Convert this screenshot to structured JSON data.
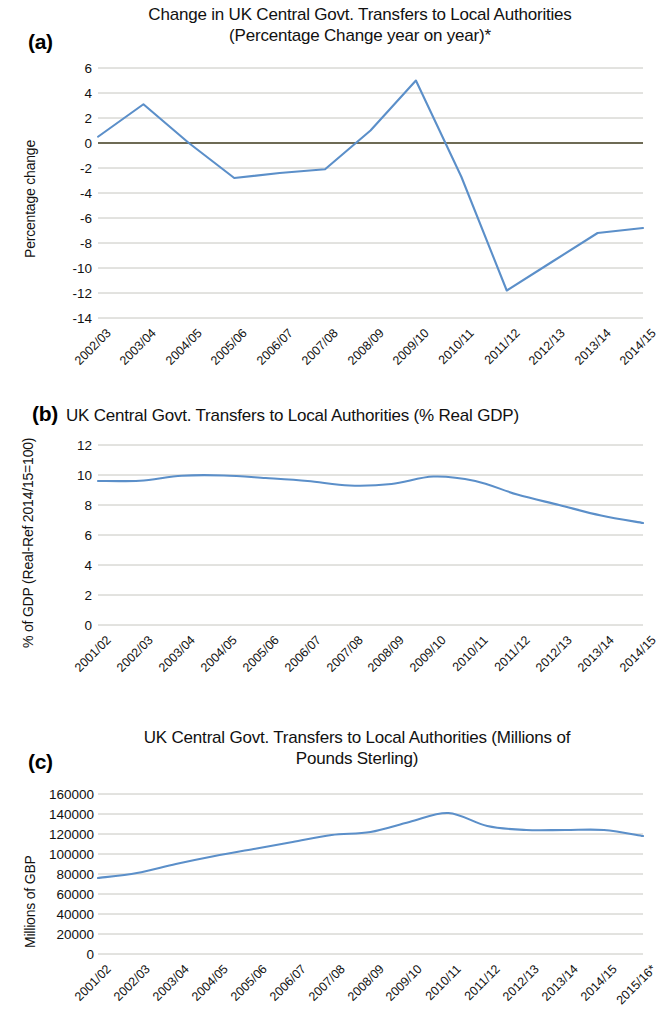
{
  "figure": {
    "panels": [
      "(a)",
      "(b)",
      "(c)"
    ]
  },
  "chart_data": [
    {
      "panel": "(a)",
      "type": "line",
      "title": "Change in UK Central Govt. Transfers to Local Authorities (Percentage Change year on year)*",
      "title_line1": "Change in UK Central Govt. Transfers to Local Authorities",
      "title_line2": "(Percentage Change year on year)*",
      "xlabel": "",
      "ylabel": "Percentage change",
      "ylim": [
        -14,
        6
      ],
      "yticks": [
        6,
        4,
        2,
        0,
        -2,
        -4,
        -6,
        -8,
        -10,
        -12,
        -14
      ],
      "ytick_labels": [
        "6",
        "4",
        "2",
        "0",
        "-2",
        "-4",
        "-6",
        "-8",
        "-10",
        "-12",
        "-14"
      ],
      "grid": true,
      "legend": "none",
      "reference_line": 0,
      "categories": [
        "2002/03",
        "2003/04",
        "2004/05",
        "2005/06",
        "2006/07",
        "2007/08",
        "2008/09",
        "2009/10",
        "2010/11",
        "2011/12",
        "2012/13",
        "2013/14",
        "2014/15"
      ],
      "values": [
        0.5,
        3.1,
        0.0,
        -2.8,
        -2.4,
        -2.1,
        1.0,
        5.0,
        -2.7,
        -11.8,
        -9.5,
        -7.2,
        -6.8
      ]
    },
    {
      "panel": "(b)",
      "type": "line",
      "title": "UK Central Govt. Transfers to Local Authorities (% Real GDP)",
      "title_line1": "UK Central Govt. Transfers to Local Authorities (% Real GDP)",
      "title_line2": "",
      "xlabel": "",
      "ylabel": "% of GDP (Real-Ref 2014/15=100)",
      "ylim": [
        0,
        12
      ],
      "yticks": [
        12,
        10,
        8,
        6,
        4,
        2,
        0
      ],
      "ytick_labels": [
        "12",
        "10",
        "8",
        "6",
        "4",
        "2",
        "0"
      ],
      "grid": true,
      "legend": "none",
      "categories": [
        "2001/02",
        "2002/03",
        "2003/04",
        "2004/05",
        "2005/06",
        "2006/07",
        "2007/08",
        "2008/09",
        "2009/10",
        "2010/11",
        "2011/12",
        "2012/13",
        "2013/14",
        "2014/15"
      ],
      "values": [
        9.6,
        9.62,
        9.95,
        9.97,
        9.8,
        9.6,
        9.3,
        9.4,
        9.9,
        9.6,
        8.7,
        8.0,
        7.3,
        6.8
      ]
    },
    {
      "panel": "(c)",
      "type": "line",
      "title": "UK Central Govt. Transfers to Local Authorities (Millions of Pounds Sterling)",
      "title_line1": "UK Central Govt. Transfers to Local Authorities (Millions of",
      "title_line2": "Pounds Sterling)",
      "xlabel": "",
      "ylabel": "Millions of GBP",
      "ylim": [
        0,
        160000
      ],
      "yticks": [
        160000,
        140000,
        120000,
        100000,
        80000,
        60000,
        40000,
        20000,
        0
      ],
      "ytick_labels": [
        "160000",
        "140000",
        "120000",
        "100000",
        "80000",
        "60000",
        "40000",
        "20000",
        "0"
      ],
      "grid": true,
      "legend": "none",
      "categories": [
        "2001/02",
        "2002/03",
        "2003/04",
        "2004/05",
        "2005/06",
        "2006/07",
        "2007/08",
        "2008/09",
        "2009/10",
        "2010/11",
        "2011/12",
        "2012/13",
        "2013/14",
        "2014/15",
        "2015/16*"
      ],
      "values": [
        76000,
        81000,
        90000,
        98000,
        105000,
        112000,
        119000,
        122000,
        132000,
        141000,
        128000,
        124000,
        124000,
        124000,
        118000
      ]
    }
  ],
  "colors": {
    "line": "#5b8fc9",
    "grid": "#b8b8b0",
    "zero_reference": "#6e6b55",
    "text": "#111111"
  }
}
